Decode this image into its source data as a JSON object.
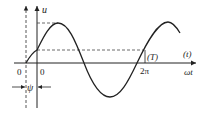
{
  "diagram": {
    "y_axis_label": "u",
    "x_axis_label": "ωt",
    "x_axis_alt_label": "(t)",
    "period_tick_label": "2π",
    "period_tick_alt_label": "(T)",
    "origin_shifted_label": "0",
    "origin_label": "0",
    "phase_label": "ψ",
    "colors": {
      "line": "#222222",
      "dashed": "#444444",
      "background": "#ffffff"
    }
  }
}
